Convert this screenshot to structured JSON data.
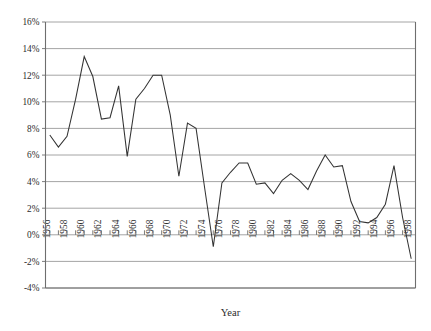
{
  "chart_data": {
    "type": "line",
    "title": "",
    "xlabel": "Year",
    "ylabel": "",
    "xlim": [
      1955.5,
      1998.5
    ],
    "ylim": [
      -4,
      16
    ],
    "grid": true,
    "legend": false,
    "ytick_labels": [
      "16%",
      "14%",
      "12%",
      "10%",
      "8%",
      "6%",
      "4%",
      "2%",
      "0%",
      "-2%",
      "-4%"
    ],
    "ytick_values": [
      16,
      14,
      12,
      10,
      8,
      6,
      4,
      2,
      0,
      -2,
      -4
    ],
    "xtick_labels": [
      "1956",
      "1958",
      "1960",
      "1962",
      "1964",
      "1966",
      "1968",
      "1970",
      "1972",
      "1974",
      "1976",
      "1978",
      "1980",
      "1982",
      "1984",
      "1986",
      "1988",
      "1990",
      "1992",
      "1994",
      "1996",
      "1998"
    ],
    "xtick_values": [
      1956,
      1958,
      1960,
      1962,
      1964,
      1966,
      1968,
      1970,
      1972,
      1974,
      1976,
      1978,
      1980,
      1982,
      1984,
      1986,
      1988,
      1990,
      1992,
      1994,
      1996,
      1998
    ],
    "x": [
      1956,
      1957,
      1958,
      1959,
      1960,
      1961,
      1962,
      1963,
      1964,
      1965,
      1966,
      1967,
      1968,
      1969,
      1970,
      1971,
      1972,
      1973,
      1974,
      1975,
      1976,
      1977,
      1978,
      1979,
      1980,
      1981,
      1982,
      1983,
      1984,
      1985,
      1986,
      1987,
      1988,
      1989,
      1990,
      1991,
      1992,
      1993,
      1994,
      1995,
      1996,
      1997,
      1998
    ],
    "values": [
      7.5,
      6.6,
      7.4,
      10.2,
      13.4,
      11.9,
      8.7,
      8.8,
      11.2,
      5.9,
      10.2,
      11.0,
      12.0,
      12.0,
      9.0,
      4.4,
      8.4,
      8.0,
      3.5,
      -0.9,
      3.9,
      4.7,
      5.4,
      5.4,
      3.8,
      3.9,
      3.1,
      4.1,
      4.6,
      4.1,
      3.4,
      4.8,
      6.0,
      5.1,
      5.2,
      2.5,
      1.0,
      0.9,
      1.3,
      2.3,
      5.2,
      1.3,
      -1.8
    ],
    "series_name": "",
    "line_color": "#333333"
  }
}
